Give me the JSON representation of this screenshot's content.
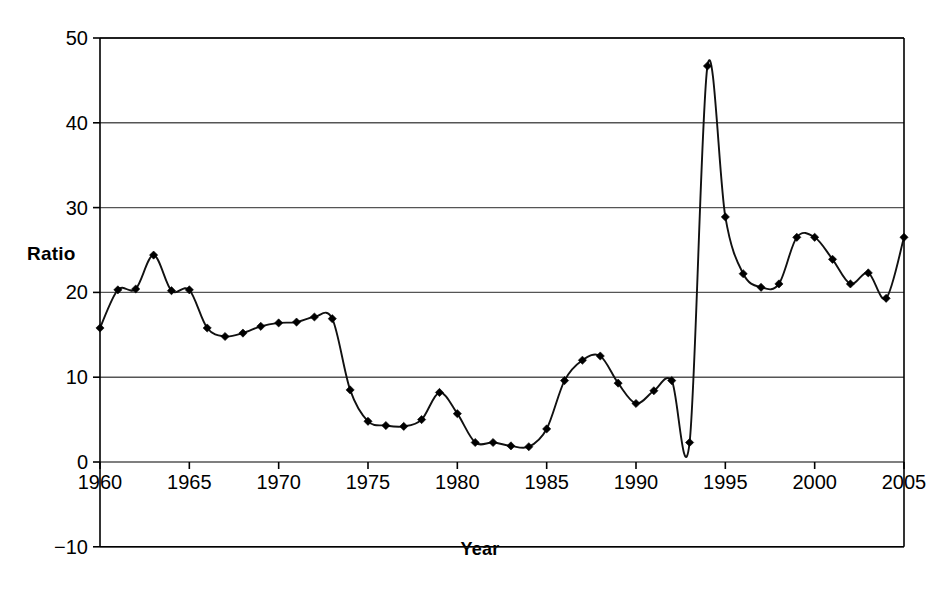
{
  "chart_data": {
    "type": "line",
    "title": "",
    "xlabel": "Year",
    "ylabel": "Ratio",
    "xlim": [
      1960,
      2005
    ],
    "ylim": [
      -10,
      50
    ],
    "yticks": [
      -10,
      0,
      10,
      20,
      30,
      40,
      50
    ],
    "ytick_labels": [
      "−10",
      "0",
      "10",
      "20",
      "30",
      "40",
      "50"
    ],
    "xticks": [
      1960,
      1965,
      1970,
      1975,
      1980,
      1985,
      1990,
      1995,
      2000,
      2005
    ],
    "xtick_labels": [
      "1960",
      "1965",
      "1970",
      "1975",
      "1980",
      "1985",
      "1990",
      "1995",
      "2000",
      "2005"
    ],
    "grid": "horizontal",
    "legend": "none",
    "marker": "diamond",
    "line_color": "#111111",
    "marker_color": "#000000",
    "grid_color": "#555555",
    "axis_color": "#000000",
    "x": [
      1960,
      1961,
      1962,
      1963,
      1964,
      1965,
      1966,
      1967,
      1968,
      1969,
      1970,
      1971,
      1972,
      1973,
      1974,
      1975,
      1976,
      1977,
      1978,
      1979,
      1980,
      1981,
      1982,
      1983,
      1984,
      1985,
      1986,
      1987,
      1988,
      1989,
      1990,
      1991,
      1992,
      1993,
      1994,
      1995,
      1996,
      1997,
      1998,
      1999,
      2000,
      2001,
      2002,
      2003,
      2004,
      2005
    ],
    "values": [
      15.8,
      20.3,
      20.4,
      24.4,
      20.2,
      20.3,
      15.8,
      14.8,
      15.2,
      16.0,
      16.4,
      16.5,
      17.1,
      16.9,
      8.5,
      4.8,
      4.3,
      4.2,
      5.0,
      8.2,
      5.7,
      2.3,
      2.3,
      1.9,
      1.8,
      3.9,
      9.6,
      12.0,
      12.5,
      9.3,
      6.9,
      8.4,
      9.6,
      2.3,
      46.7,
      28.9,
      22.2,
      20.6,
      21.0,
      26.5,
      26.5,
      23.9,
      21.0,
      22.3,
      19.3,
      26.5
    ],
    "series_name": "Ratio"
  },
  "axis": {
    "y_title": "Ratio",
    "x_title": "Year"
  }
}
